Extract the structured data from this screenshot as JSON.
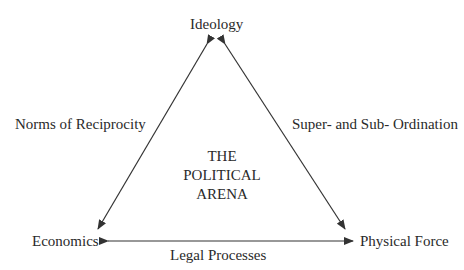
{
  "diagram": {
    "title": "THE POLITICAL ARENA",
    "center_lines": [
      "THE",
      "POLITICAL",
      "ARENA"
    ],
    "nodes": {
      "top": "Ideology",
      "bottom_left": "Economics",
      "bottom_right": "Physical Force"
    },
    "edges": {
      "left": "Norms of Reciprocity",
      "right": "Super- and Sub- Ordination",
      "bottom": "Legal Processes"
    },
    "colors": {
      "line": "#333333",
      "text": "#2a2a2a",
      "background": "#ffffff"
    }
  }
}
